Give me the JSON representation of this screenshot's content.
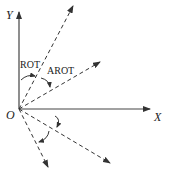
{
  "diagram": {
    "axes": {
      "x_label": "X",
      "y_label": "Y",
      "origin_label": "O"
    },
    "angle_labels": {
      "rot": "ROT",
      "arot": "AROT"
    },
    "colors": {
      "line": "#333333",
      "background": "#ffffff"
    }
  }
}
